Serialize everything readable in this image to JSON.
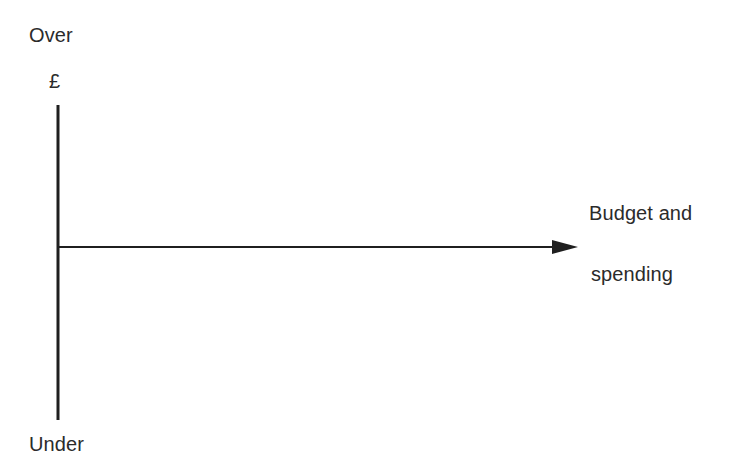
{
  "diagram": {
    "title_visible": false,
    "background_color": "#ffffff",
    "line_color": "#1f1f1f",
    "text_color": "#2b2b2b",
    "y_axis": {
      "top_label": "Over",
      "bottom_label": "Under",
      "unit_label": "£",
      "x": 58,
      "top_y": 105,
      "bottom_y": 420,
      "stroke_width": 3
    },
    "x_axis": {
      "label_line1": "Budget and",
      "label_line2": "spending",
      "y": 247,
      "start_x": 57,
      "end_x": 578,
      "stroke_width": 2,
      "arrowhead": "right-arrow-icon"
    }
  }
}
